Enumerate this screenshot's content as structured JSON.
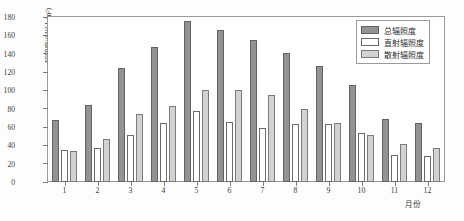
{
  "chart_data": {
    "type": "bar",
    "title": "",
    "subtitle": "",
    "xlabel": "月份",
    "ylabel": "辐照度/(kW·h/m²)",
    "categories": [
      "1",
      "2",
      "3",
      "4",
      "5",
      "6",
      "7",
      "8",
      "9",
      "10",
      "11",
      "12"
    ],
    "series": [
      {
        "name": "总辐照度",
        "color": "#939393",
        "values": [
          68,
          84,
          124,
          147,
          176,
          166,
          155,
          141,
          127,
          106,
          69,
          64
        ]
      },
      {
        "name": "直射辐照度",
        "color": "#ffffff",
        "values": [
          35,
          37,
          51,
          64,
          77,
          65,
          59,
          63,
          63,
          54,
          30,
          28
        ]
      },
      {
        "name": "散射辐照度",
        "color": "#d2d2d2",
        "values": [
          34,
          47,
          74,
          83,
          100,
          100,
          95,
          80,
          64,
          51,
          41,
          37
        ]
      }
    ],
    "ylim": [
      0,
      180
    ],
    "yticks": [
      0,
      20,
      40,
      60,
      80,
      100,
      120,
      140,
      160,
      180
    ],
    "ytick_labels": [
      "0",
      "20",
      "40",
      "60",
      "80",
      "100",
      "120",
      "140",
      "160",
      "180"
    ],
    "grid": false,
    "legend_position": "top-right",
    "legend_entries": [
      "总辐照度",
      "直射辐照度",
      "散射辐照度"
    ]
  },
  "axis": {
    "y_title": "辐照度/(kW·h/m²)",
    "x_title": "月份"
  }
}
